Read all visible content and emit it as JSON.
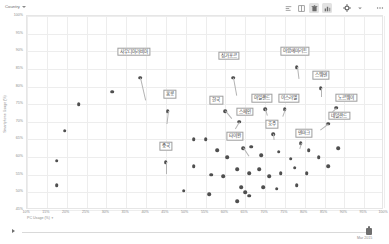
{
  "toolbar": {
    "filter_label": "Country",
    "filter_icon": "chevron-down-icon",
    "icons": [
      {
        "name": "align-left-icon",
        "glyph": "≡",
        "active": false
      },
      {
        "name": "grid-icon",
        "glyph": "▦",
        "active": false
      },
      {
        "name": "trash-icon",
        "glyph": "⬛",
        "active": true
      },
      {
        "name": "chart-icon",
        "glyph": "▓",
        "active": true
      },
      {
        "name": "gear-icon",
        "glyph": "⚙",
        "active": false
      },
      {
        "name": "chevron-down-icon",
        "glyph": "▾",
        "active": false
      },
      {
        "name": "more-icon",
        "glyph": "⋯",
        "active": false
      }
    ]
  },
  "footer": {
    "play_icon": "play-icon",
    "handle_icon": "timeline-handle-icon",
    "date_label": "Mar 2015"
  },
  "chart_data": {
    "type": "scatter",
    "title": "",
    "xlabel": "PC Usage (%)",
    "ylabel": "Smartphone Usage (%)",
    "xlim": [
      10,
      100
    ],
    "ylim": [
      45,
      100
    ],
    "xticks": [
      "10%",
      "15%",
      "20%",
      "25%",
      "30%",
      "35%",
      "40%",
      "45%",
      "50%",
      "55%",
      "60%",
      "65%",
      "70%",
      "75%",
      "80%",
      "85%",
      "90%",
      "95%",
      "100%"
    ],
    "yticks": [
      "100%",
      "95%",
      "90%",
      "85%",
      "80%",
      "75%",
      "70%",
      "65%",
      "60%",
      "55%",
      "50%",
      "45%"
    ],
    "grid": true,
    "legend": "none",
    "points": [
      {
        "x": 19.5,
        "y": 67.5,
        "label": ""
      },
      {
        "x": 23.0,
        "y": 75.0,
        "label": ""
      },
      {
        "x": 17.5,
        "y": 59.0,
        "label": ""
      },
      {
        "x": 17.5,
        "y": 52.0,
        "label": ""
      },
      {
        "x": 31.5,
        "y": 78.5,
        "label": ""
      },
      {
        "x": 38.5,
        "y": 82.5,
        "label": "사우디아라비아"
      },
      {
        "x": 45.5,
        "y": 73.0,
        "label": "홍콩"
      },
      {
        "x": 52.0,
        "y": 65.0,
        "label": ""
      },
      {
        "x": 55.0,
        "y": 65.0,
        "label": ""
      },
      {
        "x": 45.0,
        "y": 58.5,
        "label": "중국"
      },
      {
        "x": 62.0,
        "y": 82.5,
        "label": "싱가포르"
      },
      {
        "x": 60.0,
        "y": 73.0,
        "label": "한국"
      },
      {
        "x": 63.5,
        "y": 70.0,
        "label": "스페인"
      },
      {
        "x": 64.5,
        "y": 62.5,
        "label": "타이완"
      },
      {
        "x": 70.0,
        "y": 73.5,
        "label": "아일랜드"
      },
      {
        "x": 75.0,
        "y": 73.5,
        "label": "이스라엘"
      },
      {
        "x": 78.0,
        "y": 85.5,
        "label": "아랍에미리트"
      },
      {
        "x": 84.0,
        "y": 79.5,
        "label": "스웨덴"
      },
      {
        "x": 88.0,
        "y": 74.0,
        "label": "노르웨이"
      },
      {
        "x": 86.0,
        "y": 69.5,
        "label": "네덜란드"
      },
      {
        "x": 79.0,
        "y": 64.0,
        "label": "덴마크"
      },
      {
        "x": 72.0,
        "y": 66.5,
        "label": "호주"
      },
      {
        "x": 58.0,
        "y": 62.0,
        "label": ""
      },
      {
        "x": 60.5,
        "y": 60.0,
        "label": ""
      },
      {
        "x": 66.5,
        "y": 63.0,
        "label": ""
      },
      {
        "x": 69.0,
        "y": 60.5,
        "label": ""
      },
      {
        "x": 73.5,
        "y": 61.5,
        "label": ""
      },
      {
        "x": 76.5,
        "y": 59.5,
        "label": ""
      },
      {
        "x": 81.0,
        "y": 62.0,
        "label": ""
      },
      {
        "x": 83.5,
        "y": 60.0,
        "label": ""
      },
      {
        "x": 88.5,
        "y": 62.5,
        "label": ""
      },
      {
        "x": 52.0,
        "y": 57.5,
        "label": ""
      },
      {
        "x": 56.5,
        "y": 55.0,
        "label": ""
      },
      {
        "x": 59.5,
        "y": 54.5,
        "label": ""
      },
      {
        "x": 63.0,
        "y": 56.5,
        "label": ""
      },
      {
        "x": 66.0,
        "y": 55.5,
        "label": ""
      },
      {
        "x": 68.5,
        "y": 56.5,
        "label": ""
      },
      {
        "x": 71.0,
        "y": 54.5,
        "label": ""
      },
      {
        "x": 74.0,
        "y": 55.5,
        "label": ""
      },
      {
        "x": 77.5,
        "y": 57.0,
        "label": ""
      },
      {
        "x": 80.5,
        "y": 55.5,
        "label": ""
      },
      {
        "x": 86.0,
        "y": 57.5,
        "label": ""
      },
      {
        "x": 64.0,
        "y": 51.5,
        "label": ""
      },
      {
        "x": 65.0,
        "y": 50.0,
        "label": ""
      },
      {
        "x": 66.0,
        "y": 49.0,
        "label": ""
      },
      {
        "x": 69.5,
        "y": 51.5,
        "label": ""
      },
      {
        "x": 73.0,
        "y": 51.0,
        "label": ""
      },
      {
        "x": 49.5,
        "y": 50.5,
        "label": ""
      },
      {
        "x": 56.0,
        "y": 49.5,
        "label": ""
      },
      {
        "x": 78.0,
        "y": 52.0,
        "label": ""
      },
      {
        "x": 63.0,
        "y": 47.5,
        "label": ""
      }
    ]
  }
}
